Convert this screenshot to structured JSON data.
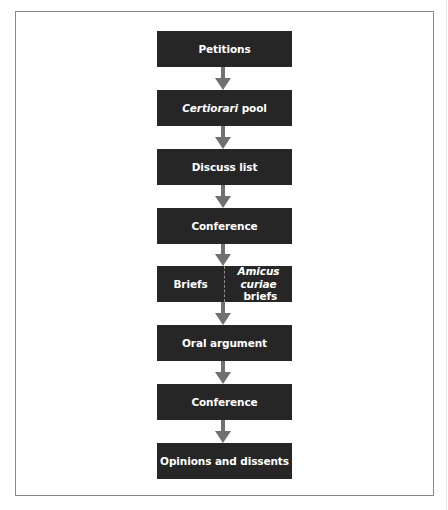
{
  "diagram": {
    "type": "flowchart",
    "direction": "top-to-bottom",
    "colors": {
      "box_fill": "#262626",
      "box_text": "#ffffff",
      "arrow": "#707070",
      "frame": "#8a8a8a"
    },
    "steps": [
      {
        "label": "Petitions"
      },
      {
        "label_italic": "Certiorari",
        "label_rest": " pool"
      },
      {
        "label": "Discuss list"
      },
      {
        "label": "Conference"
      },
      {
        "left_label": "Briefs",
        "right_label_italic": "Amicus",
        "right_label_line2_italic": "curiae",
        "right_label_line2_rest": " briefs"
      },
      {
        "label": "Oral argument"
      },
      {
        "label": "Conference"
      },
      {
        "label": "Opinions and dissents"
      }
    ]
  }
}
